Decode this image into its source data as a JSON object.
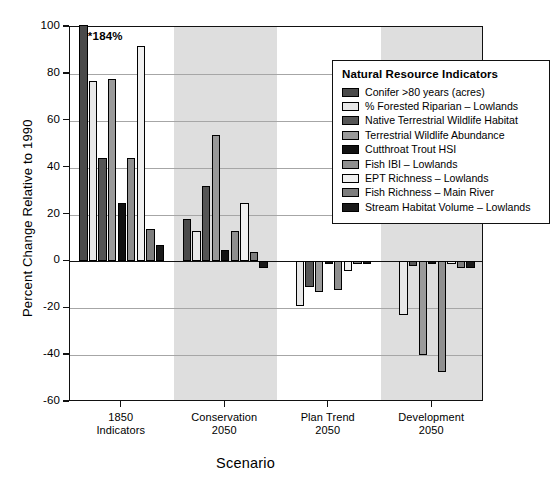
{
  "chart_data": {
    "type": "bar",
    "title": "",
    "xlabel": "Scenario",
    "ylabel": "Percent Change Relative to 1990",
    "ylim": [
      -60,
      100
    ],
    "yticks": [
      100,
      80,
      60,
      40,
      20,
      0,
      -20,
      -40,
      -60
    ],
    "ytick_labels": [
      "100",
      "80",
      "60",
      "40",
      "20",
      "0",
      "-20",
      "-40",
      "-60"
    ],
    "grid": true,
    "legend_position": "top-right",
    "legend_title": "Natural Resource Indicators",
    "categories": [
      "1850\nIndicators",
      "Conservation\n2050",
      "Plan Trend\n2050",
      "Development\n2050"
    ],
    "category_lines": [
      [
        "1850",
        "Indicators"
      ],
      [
        "Conservation",
        "2050"
      ],
      [
        "Plan Trend",
        "2050"
      ],
      [
        "Development",
        "2050"
      ]
    ],
    "annotations": [
      {
        "text": "*184%",
        "series": "Conifer >80 years (acres)",
        "category": "1850 Indicators",
        "value": 184,
        "note": "bar clipped at axis maximum"
      }
    ],
    "series": [
      {
        "name": "Conifer >80 years (acres)",
        "color": "#4a4a4a",
        "values": [
          184,
          18,
          0,
          0
        ]
      },
      {
        "name": "% Forested Riparian – Lowlands",
        "color": "#e8e8e8",
        "values": [
          77,
          13,
          -19,
          -23
        ]
      },
      {
        "name": "Native Terrestrial Wildlife Habitat",
        "color": "#555555",
        "values": [
          44,
          32,
          -11,
          -2
        ]
      },
      {
        "name": "Terrestrial Wildlife Abundance",
        "color": "#9a9a9a",
        "values": [
          78,
          54,
          -13,
          -40
        ]
      },
      {
        "name": "Cutthroat Trout HSI",
        "color": "#111111",
        "values": [
          25,
          5,
          -1,
          -1
        ]
      },
      {
        "name": "Fish IBI – Lowlands",
        "color": "#8f8f8f",
        "values": [
          44,
          13,
          -12,
          -47
        ]
      },
      {
        "name": "EPT Richness – Lowlands",
        "color": "#f0f0f0",
        "values": [
          92,
          25,
          -4,
          -1
        ]
      },
      {
        "name": "Fish Richness – Main River",
        "color": "#7d7d7d",
        "values": [
          14,
          4,
          -1,
          -3
        ]
      },
      {
        "name": "Stream Habitat Volume – Lowlands",
        "color": "#1a1a1a",
        "values": [
          7,
          -3,
          -1,
          -3
        ]
      }
    ]
  },
  "legend": {
    "title": "Natural Resource Indicators"
  },
  "axes": {
    "y_title": "Percent Change Relative to 1990",
    "x_title": "Scenario"
  }
}
